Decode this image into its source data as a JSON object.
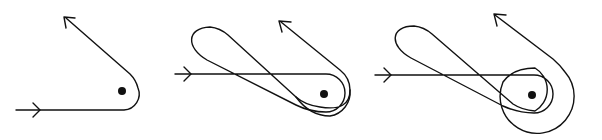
{
  "figure": {
    "width": 602,
    "height": 140,
    "background": "#ffffff",
    "ink": "#111111",
    "panels": [
      {
        "id": "panel-1",
        "description": "single turn around obstacle",
        "center": [
          122,
          91
        ],
        "paths": [
          "M 16 110 L 124 110 A 16 16 0 0 0 133 82 L 66 18"
        ],
        "arrowheads": [
          {
            "at": [
              40,
              110
            ],
            "dir": "right"
          },
          {
            "at": [
              66,
              18
            ],
            "dir": "up-left"
          }
        ]
      },
      {
        "id": "panel-2",
        "description": "loop then turn around obstacle",
        "center": [
          324,
          94
        ],
        "paths": [
          "M 175 74 L 324 74 A 20 20 0 0 1 324 112 Q 308 112 292 104 L 208 60 C 180 46 185 24 208 27 Q 218 28 225 35 L 292 96 Q 300 104 318 105 A 25 25 0 1 0 338 70 L 281 22"
        ],
        "arrowheads": [
          {
            "at": [
              195,
              74
            ],
            "dir": "right"
          },
          {
            "at": [
              281,
              22
            ],
            "dir": "up-left"
          }
        ]
      },
      {
        "id": "panel-3",
        "description": "loop, turns and full circle around obstacle",
        "center": [
          532,
          95
        ],
        "paths": [
          "M 375 75 L 532 75 A 20 20 0 0 1 532 113 Q 515 113 500 104 L 410 57 C 388 46 393 24 413 26 Q 423 27 430 34 L 510 103 Q 518 108 535 110 A 28 28 0 1 0 506 82 A 35 35 0 1 0 553 62 L 495 15"
        ],
        "arrowheads": [
          {
            "at": [
              392,
              75
            ],
            "dir": "right"
          },
          {
            "at": [
              495,
              15
            ],
            "dir": "up-left"
          }
        ]
      }
    ]
  }
}
